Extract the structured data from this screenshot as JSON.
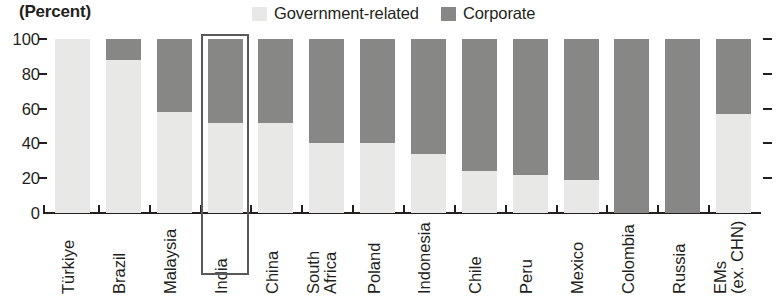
{
  "header": {
    "unit_label": "(Percent)"
  },
  "legend": {
    "position": "top-center",
    "entries": [
      {
        "label": "Government-related",
        "color": "#e8e8e6",
        "icon": "square-swatch-icon"
      },
      {
        "label": "Corporate",
        "color": "#878786",
        "icon": "square-swatch-icon"
      }
    ]
  },
  "axis": {
    "y_ticks": [
      "0",
      "20",
      "40",
      "60",
      "80",
      "100"
    ],
    "y_min": 0,
    "y_max": 100
  },
  "highlight": {
    "category": "India",
    "color": "#58595b"
  },
  "chart_data": {
    "type": "bar",
    "stacked": true,
    "title": "",
    "subtitle": "",
    "xlabel": "",
    "ylabel": "(Percent)",
    "ylim": [
      0,
      100
    ],
    "grid": false,
    "legend_position": "top-center",
    "categories": [
      "Türkiye",
      "Brazil",
      "Malaysia",
      "India",
      "China",
      "South Africa",
      "Poland",
      "Indonesia",
      "Chile",
      "Peru",
      "Mexico",
      "Colombia",
      "Russia",
      "EMs (ex. CHN)"
    ],
    "category_lines": [
      [
        "Türkiye"
      ],
      [
        "Brazil"
      ],
      [
        "Malaysia"
      ],
      [
        "India"
      ],
      [
        "China"
      ],
      [
        "South",
        "Africa"
      ],
      [
        "Poland"
      ],
      [
        "Indonesia"
      ],
      [
        "Chile"
      ],
      [
        "Peru"
      ],
      [
        "Mexico"
      ],
      [
        "Colombia"
      ],
      [
        "Russia"
      ],
      [
        "EMs",
        "(ex. CHN)"
      ]
    ],
    "series": [
      {
        "name": "Government-related",
        "color": "#e8e8e6",
        "values": [
          100,
          88,
          58,
          52,
          52,
          40,
          40,
          34,
          24,
          22,
          19,
          0,
          0,
          57
        ]
      },
      {
        "name": "Corporate",
        "color": "#878786",
        "values": [
          0,
          12,
          42,
          48,
          48,
          60,
          60,
          66,
          76,
          78,
          81,
          100,
          100,
          43
        ]
      }
    ],
    "highlighted_category": "India"
  }
}
